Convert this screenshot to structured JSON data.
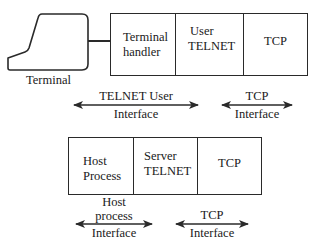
{
  "diagram": {
    "title": "",
    "type": "telnet-architecture",
    "colors": {
      "stroke": "#2a2a2a",
      "text": "#1a1a1a",
      "background": "#ffffff"
    },
    "top": {
      "terminal": {
        "icon": "terminal-icon",
        "label": "Terminal"
      },
      "stack": [
        {
          "line1": "Terminal",
          "line2": "handler"
        },
        {
          "line1": "User",
          "line2": "TELNET"
        },
        {
          "line1": "TCP",
          "line2": ""
        }
      ],
      "interfaces": [
        {
          "line1": "TELNET User",
          "line2": "Interface"
        },
        {
          "line1": "TCP",
          "line2": "Interface"
        }
      ]
    },
    "bottom": {
      "stack": [
        {
          "line1": "Host",
          "line2": "Process"
        },
        {
          "line1": "Server",
          "line2": "TELNET"
        },
        {
          "line1": "TCP",
          "line2": ""
        }
      ],
      "interfaces": [
        {
          "line1": "Host",
          "line2": "process",
          "line3": "Interface"
        },
        {
          "line1": "TCP",
          "line2": "Interface"
        }
      ]
    }
  }
}
